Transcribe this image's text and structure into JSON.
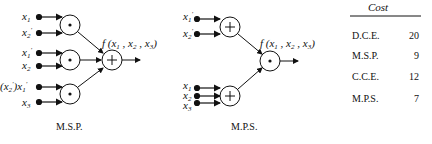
{
  "msp": {
    "caption": "M.S.P.",
    "inputs": [
      "x1",
      "x2'",
      "x1'",
      "x2",
      "(x2')x1'",
      "x3"
    ],
    "output_label": "f(x1, x2, x3)",
    "gates": [
      "AND",
      "AND",
      "AND",
      "OR"
    ]
  },
  "mps": {
    "caption": "M.P.S.",
    "inputs": [
      "x1'",
      "x2'",
      "x1",
      "x2",
      "x3"
    ],
    "output_label": "f(x1, x2, x3)",
    "gates": [
      "OR",
      "OR",
      "AND"
    ]
  },
  "cost_table": {
    "header": "Cost",
    "rows": [
      {
        "label": "D.C.E.",
        "value": "20"
      },
      {
        "label": "M.S.P.",
        "value": "9"
      },
      {
        "label": "C.C.E.",
        "value": "12"
      },
      {
        "label": "M.P.S.",
        "value": "7"
      }
    ]
  }
}
